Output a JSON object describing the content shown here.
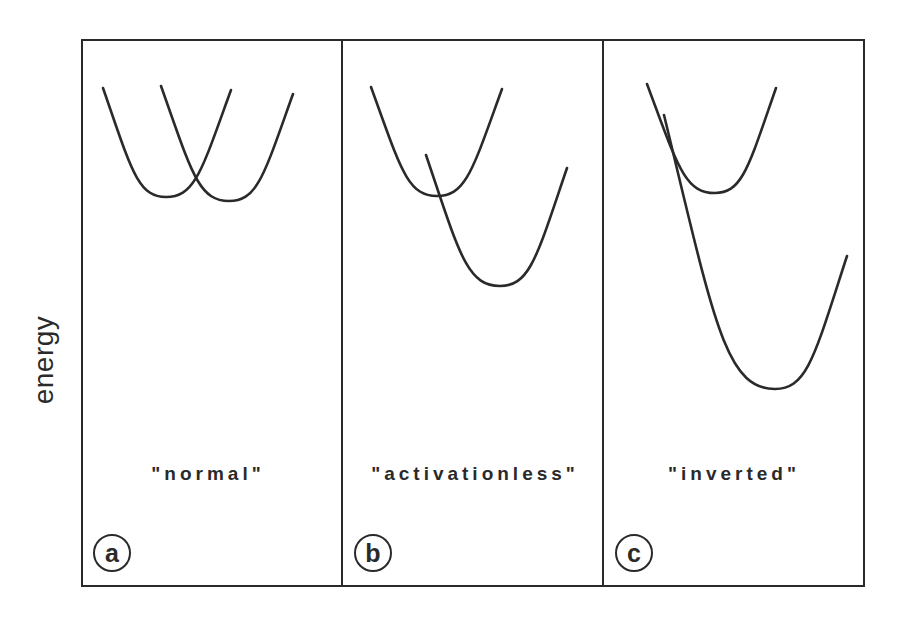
{
  "figure": {
    "y_axis_label": "energy",
    "panels": [
      {
        "id": "a",
        "letter": "a",
        "label": "\"normal\"",
        "curves": [
          {
            "role": "reactant",
            "start": [
              103,
              88
            ],
            "min": [
              166,
              197
            ],
            "end": [
              231,
              90
            ]
          },
          {
            "role": "product",
            "start": [
              161,
              86
            ],
            "min": [
              229,
              201
            ],
            "end": [
              293,
              94
            ]
          }
        ]
      },
      {
        "id": "b",
        "letter": "b",
        "label": "\"activationless\"",
        "curves": [
          {
            "role": "reactant",
            "start": [
              371,
              87
            ],
            "min": [
              437,
              196
            ],
            "end": [
              502,
              89
            ]
          },
          {
            "role": "product",
            "start": [
              426,
              155
            ],
            "min": [
              500,
              286
            ],
            "end": [
              567,
              168
            ]
          }
        ]
      },
      {
        "id": "c",
        "letter": "c",
        "label": "\"inverted\"",
        "curves": [
          {
            "role": "reactant",
            "start": [
              647,
              84
            ],
            "min": [
              715,
              193
            ],
            "end": [
              776,
              88
            ]
          },
          {
            "role": "product",
            "start": [
              664,
              115
            ],
            "min": [
              775,
              389
            ],
            "end": [
              847,
              256
            ]
          }
        ]
      }
    ],
    "colors": {
      "line": "#2a2a2a",
      "background": "#ffffff"
    }
  }
}
